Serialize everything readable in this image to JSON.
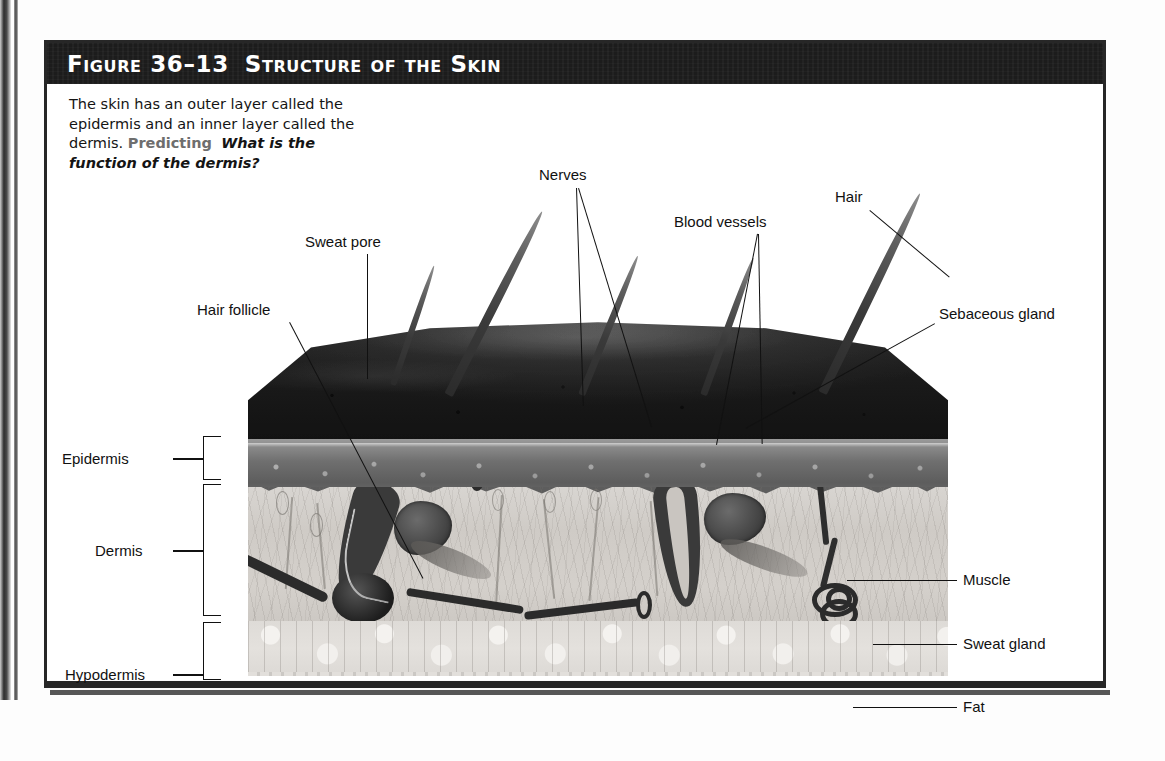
{
  "figure": {
    "number_label": "Figure 36–13",
    "title": "Structure of the Skin",
    "caption_part1": "The skin has an outer layer called the epidermis and an inner layer called the dermis. ",
    "caption_skill": "Predicting",
    "caption_question": "What is the function of the dermis?"
  },
  "colors": {
    "banner_background": "#1c1c1c",
    "banner_text": "#ffffff",
    "skill_label": "#6e6e6e",
    "frame_border": "#272727",
    "label_text": "#111111",
    "leader_line": "#111111",
    "epidermis_tone": "#6f6f6f",
    "dermis_tone": "#d4d0cb",
    "hypodermis_tone": "#e4e1dd",
    "surface_tone": "#1f1f1f"
  },
  "layer_brackets": [
    {
      "name": "epidermis",
      "label": "Epidermis"
    },
    {
      "name": "dermis",
      "label": "Dermis"
    },
    {
      "name": "hypodermis",
      "label": "Hypodermis"
    }
  ],
  "callouts_top": [
    {
      "name": "sweat-pore",
      "label": "Sweat pore"
    },
    {
      "name": "nerves",
      "label": "Nerves"
    },
    {
      "name": "blood-vessels",
      "label": "Blood vessels"
    },
    {
      "name": "hair",
      "label": "Hair"
    }
  ],
  "callouts_left": [
    {
      "name": "hair-follicle",
      "label": "Hair follicle"
    }
  ],
  "callouts_right": [
    {
      "name": "sebaceous-gland",
      "label": "Sebaceous gland"
    },
    {
      "name": "muscle",
      "label": "Muscle"
    },
    {
      "name": "sweat-gland",
      "label": "Sweat gland"
    },
    {
      "name": "fat",
      "label": "Fat"
    }
  ],
  "diagram": {
    "type": "labeled-anatomical-cross-section",
    "layers_top_to_bottom": [
      "Epidermis",
      "Dermis",
      "Hypodermis"
    ],
    "structures": [
      "Sweat pore",
      "Hair",
      "Hair follicle",
      "Sebaceous gland",
      "Muscle",
      "Sweat gland",
      "Nerves",
      "Blood vessels",
      "Fat"
    ]
  }
}
